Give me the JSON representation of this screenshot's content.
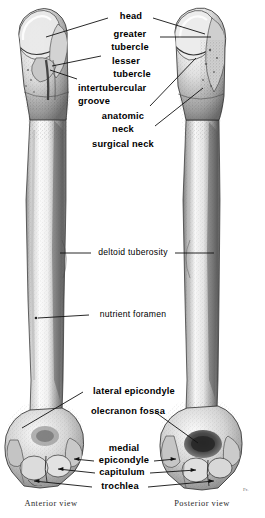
{
  "figure": {
    "background": "#ffffff",
    "ink": "#1a1a1a",
    "signature": "Fr."
  },
  "views": [
    {
      "id": "anterior",
      "caption": "Anterior view"
    },
    {
      "id": "posterior",
      "caption": "Posterior view"
    }
  ],
  "labels": [
    {
      "id": "head",
      "text": "head",
      "weight": "bold"
    },
    {
      "id": "greater-tubercle-1",
      "text": "greater",
      "weight": "bold"
    },
    {
      "id": "greater-tubercle-2",
      "text": "tubercle",
      "weight": "bold"
    },
    {
      "id": "lesser-tubercle-1",
      "text": "lesser",
      "weight": "bold"
    },
    {
      "id": "lesser-tubercle-2",
      "text": "tubercle",
      "weight": "bold"
    },
    {
      "id": "intertubercular-1",
      "text": "intertubercular",
      "weight": "bold"
    },
    {
      "id": "intertubercular-2",
      "text": "groove",
      "weight": "bold"
    },
    {
      "id": "anatomic-neck-1",
      "text": "anatomic",
      "weight": "bold"
    },
    {
      "id": "anatomic-neck-2",
      "text": "neck",
      "weight": "bold"
    },
    {
      "id": "surgical-neck",
      "text": "surgical neck",
      "weight": "bold"
    },
    {
      "id": "deltoid-tuberosity",
      "text": "deltoid tuberosity",
      "weight": "regular"
    },
    {
      "id": "nutrient-foramen",
      "text": "nutrient foramen",
      "weight": "regular"
    },
    {
      "id": "lateral-epicondyle",
      "text": "lateral epicondyle",
      "weight": "bold"
    },
    {
      "id": "olecranon-fossa",
      "text": "olecranon fossa",
      "weight": "bold"
    },
    {
      "id": "medial-epicondyle-1",
      "text": "medial",
      "weight": "bold"
    },
    {
      "id": "medial-epicondyle-2",
      "text": "epicondyle",
      "weight": "bold"
    },
    {
      "id": "capitulum",
      "text": "capitulum",
      "weight": "bold"
    },
    {
      "id": "trochlea",
      "text": "trochlea",
      "weight": "bold"
    }
  ]
}
